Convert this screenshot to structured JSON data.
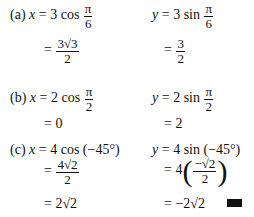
{
  "parts": {
    "a": {
      "label": "(a)",
      "x_lhs": "x",
      "x_expr": "3 cos",
      "x_arg_num": "π",
      "x_arg_den": "6",
      "x_res_num": "3√3",
      "x_res_den": "2",
      "y_lhs": "y",
      "y_expr": "3 sin",
      "y_arg_num": "π",
      "y_arg_den": "6",
      "y_res_num": "3",
      "y_res_den": "2"
    },
    "b": {
      "label": "(b)",
      "x_lhs": "x",
      "x_expr": "2 cos",
      "x_arg_num": "π",
      "x_arg_den": "2",
      "x_res": "0",
      "y_lhs": "y",
      "y_expr": "2 sin",
      "y_arg_num": "π",
      "y_arg_den": "2",
      "y_res": "2"
    },
    "c": {
      "label": "(c)",
      "x_lhs": "x",
      "x_expr": "4 cos (−45°)",
      "x_step_num": "4√2",
      "x_step_den": "2",
      "x_res": "2√2",
      "y_lhs": "y",
      "y_expr": "4 sin (−45°)",
      "y_step_coef": "4",
      "y_step_num": "−√2",
      "y_step_den": "2",
      "y_res": "−2√2"
    }
  },
  "eq": "="
}
